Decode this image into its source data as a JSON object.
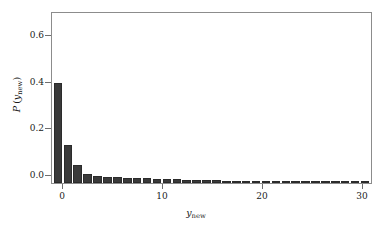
{
  "chart_data": {
    "type": "bar",
    "title": "",
    "subtitle": "",
    "xlabel": "y_new",
    "ylabel": "P(y_new)",
    "xlabel_base": "y",
    "xlabel_sub": "new",
    "ylabel_prefix": "P",
    "ylabel_base": "y",
    "ylabel_sub": "new",
    "grid": false,
    "legend": null,
    "xlim": [
      -0.6,
      31.6
    ],
    "ylim": [
      0.0,
      0.7375
    ],
    "xticks": [
      0,
      10,
      20,
      30
    ],
    "xticklabels": [
      "0",
      "10",
      "20",
      "30"
    ],
    "yticks": [
      0.0,
      0.2,
      0.4,
      0.6
    ],
    "yticklabels": [
      "0.0",
      "0.2",
      "0.4",
      "0.6"
    ],
    "bar_color": "#3a3a3a",
    "edge_color": "#2b2b2b",
    "background_color": "#ffffff",
    "frame_color": "#8c8c8c",
    "categories": [
      0,
      1,
      2,
      3,
      4,
      5,
      6,
      7,
      8,
      9,
      10,
      11,
      12,
      13,
      14,
      15,
      16,
      17,
      18,
      19,
      20,
      21,
      22,
      23,
      24,
      25,
      26,
      27,
      28,
      29,
      30,
      31
    ],
    "values": [
      0.433,
      0.167,
      0.077,
      0.04,
      0.03,
      0.027,
      0.026,
      0.022,
      0.021,
      0.02,
      0.019,
      0.018,
      0.016,
      0.015,
      0.014,
      0.012,
      0.011,
      0.01,
      0.009,
      0.009,
      0.008,
      0.008,
      0.007,
      0.007,
      0.006,
      0.006,
      0.005,
      0.005,
      0.005,
      0.004,
      0.004,
      0.004
    ]
  },
  "axis": {
    "x_tick_0": "0",
    "x_tick_10": "10",
    "x_tick_20": "20",
    "x_tick_30": "30",
    "y_tick_00": "0.0",
    "y_tick_02": "0.2",
    "y_tick_04": "0.4",
    "y_tick_06": "0.6"
  }
}
